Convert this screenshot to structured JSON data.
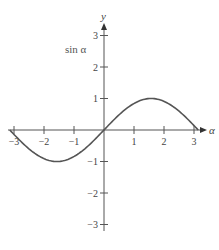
{
  "chart_data": {
    "type": "line",
    "title": "",
    "function_label": "sin α",
    "xlabel": "α",
    "ylabel": "y",
    "xlim": [
      -3.14159,
      3.14159
    ],
    "ylim": [
      -3,
      3
    ],
    "x_ticks": [
      -3,
      -2,
      -1,
      1,
      2,
      3
    ],
    "y_ticks": [
      -3,
      -2,
      -1,
      1,
      2,
      3
    ],
    "x_tick_labels": [
      "−3",
      "−2",
      "−1",
      "1",
      "2",
      "3"
    ],
    "y_tick_labels": [
      "−3",
      "−2",
      "−1",
      "1",
      "2",
      "3"
    ],
    "grid": false,
    "legend": null,
    "series": [
      {
        "name": "sin α",
        "x": [
          -3.14,
          -2.5,
          -2.0,
          -1.57,
          -1.0,
          -0.5,
          0,
          0.5,
          1.0,
          1.57,
          2.0,
          2.5,
          3.14
        ],
        "values": [
          0,
          -0.6,
          -0.91,
          -1,
          -0.84,
          -0.48,
          0,
          0.48,
          0.84,
          1,
          0.91,
          0.6,
          0
        ],
        "color": "#555555"
      }
    ]
  },
  "labels": {
    "x_axis": "α",
    "y_axis": "y",
    "function": "sin α"
  },
  "colors": {
    "axis": "#555555",
    "curve": "#555555",
    "text": "#444444"
  }
}
